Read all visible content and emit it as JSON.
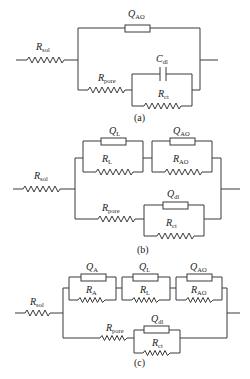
{
  "colors": {
    "line": "#3a3a3a",
    "text": "#222222",
    "background": "#ffffff"
  },
  "diagrams": [
    {
      "caption": "(a)",
      "labels": {
        "rsol": {
          "main": "R",
          "sub": "sol"
        },
        "qao": {
          "main": "Q",
          "sub": "AO"
        },
        "rpore": {
          "main": "R",
          "sub": "pore"
        },
        "cdl": {
          "main": "C",
          "sub": "dl"
        },
        "rct": {
          "main": "R",
          "sub": "ct"
        }
      }
    },
    {
      "caption": "(b)",
      "labels": {
        "rsol": {
          "main": "R",
          "sub": "sol"
        },
        "ql": {
          "main": "Q",
          "sub": "L"
        },
        "rl": {
          "main": "R",
          "sub": "L"
        },
        "qao": {
          "main": "Q",
          "sub": "AO"
        },
        "rao": {
          "main": "R",
          "sub": "AO"
        },
        "rpore": {
          "main": "R",
          "sub": "pore"
        },
        "qdl": {
          "main": "Q",
          "sub": "dl"
        },
        "rct": {
          "main": "R",
          "sub": "ct"
        }
      }
    },
    {
      "caption": "(c)",
      "labels": {
        "rsol": {
          "main": "R",
          "sub": "sol"
        },
        "qa": {
          "main": "Q",
          "sub": "A"
        },
        "ra": {
          "main": "R",
          "sub": "A"
        },
        "ql": {
          "main": "Q",
          "sub": "L"
        },
        "rl": {
          "main": "R",
          "sub": "L"
        },
        "qao": {
          "main": "Q",
          "sub": "AO"
        },
        "rao": {
          "main": "R",
          "sub": "AO"
        },
        "rpore": {
          "main": "R",
          "sub": "pore"
        },
        "qdl": {
          "main": "Q",
          "sub": "dl"
        },
        "rct": {
          "main": "R",
          "sub": "ct"
        }
      }
    }
  ]
}
